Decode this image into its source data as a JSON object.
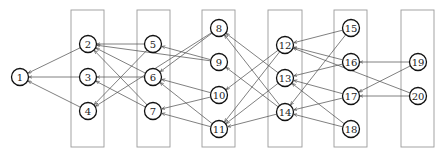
{
  "diagram": {
    "type": "layered directed graph",
    "colors": {
      "background": "#ffffff",
      "box_stroke": "#9a9a9a",
      "edge": "#555555",
      "node_stroke": "#111111",
      "label": "#222222"
    },
    "node_radius": 8.5,
    "columns": [
      {
        "id": "c1",
        "x": 71,
        "y": 10,
        "w": 33,
        "h": 137
      },
      {
        "id": "c2",
        "x": 137,
        "y": 10,
        "w": 33,
        "h": 137
      },
      {
        "id": "c3",
        "x": 202,
        "y": 10,
        "w": 33,
        "h": 137
      },
      {
        "id": "c4",
        "x": 268,
        "y": 10,
        "w": 34,
        "h": 137
      },
      {
        "id": "c5",
        "x": 334,
        "y": 10,
        "w": 33,
        "h": 137
      },
      {
        "id": "c6",
        "x": 401,
        "y": 10,
        "w": 33,
        "h": 137
      }
    ],
    "nodes": [
      {
        "id": "1",
        "label": "1",
        "x": 20,
        "y": 77
      },
      {
        "id": "2",
        "label": "2",
        "x": 88,
        "y": 44
      },
      {
        "id": "3",
        "label": "3",
        "x": 88,
        "y": 77
      },
      {
        "id": "4",
        "label": "4",
        "x": 88,
        "y": 111
      },
      {
        "id": "5",
        "label": "5",
        "x": 153,
        "y": 44
      },
      {
        "id": "6",
        "label": "6",
        "x": 153,
        "y": 77
      },
      {
        "id": "7",
        "label": "7",
        "x": 153,
        "y": 111
      },
      {
        "id": "8",
        "label": "8",
        "x": 219,
        "y": 28
      },
      {
        "id": "9",
        "label": "9",
        "x": 219,
        "y": 62
      },
      {
        "id": "10",
        "label": "10",
        "x": 219,
        "y": 95
      },
      {
        "id": "11",
        "label": "11",
        "x": 219,
        "y": 129
      },
      {
        "id": "12",
        "label": "12",
        "x": 285,
        "y": 45
      },
      {
        "id": "13",
        "label": "13",
        "x": 285,
        "y": 78
      },
      {
        "id": "14",
        "label": "14",
        "x": 285,
        "y": 112
      },
      {
        "id": "15",
        "label": "15",
        "x": 351,
        "y": 28
      },
      {
        "id": "16",
        "label": "16",
        "x": 351,
        "y": 62
      },
      {
        "id": "17",
        "label": "17",
        "x": 351,
        "y": 96
      },
      {
        "id": "18",
        "label": "18",
        "x": 351,
        "y": 129
      },
      {
        "id": "19",
        "label": "19",
        "x": 418,
        "y": 62
      },
      {
        "id": "20",
        "label": "20",
        "x": 418,
        "y": 96
      }
    ],
    "edges": [
      {
        "from": "2",
        "to": "1"
      },
      {
        "from": "3",
        "to": "1"
      },
      {
        "from": "4",
        "to": "1"
      },
      {
        "from": "5",
        "to": "2"
      },
      {
        "from": "9",
        "to": "2"
      },
      {
        "from": "6",
        "to": "2"
      },
      {
        "from": "7",
        "to": "2"
      },
      {
        "from": "6",
        "to": "3"
      },
      {
        "from": "7",
        "to": "3"
      },
      {
        "from": "5",
        "to": "4"
      },
      {
        "from": "8",
        "to": "4"
      },
      {
        "from": "9",
        "to": "5"
      },
      {
        "from": "8",
        "to": "6"
      },
      {
        "from": "10",
        "to": "6"
      },
      {
        "from": "11",
        "to": "6"
      },
      {
        "from": "10",
        "to": "7"
      },
      {
        "from": "11",
        "to": "7"
      },
      {
        "from": "13",
        "to": "8"
      },
      {
        "from": "14",
        "to": "8"
      },
      {
        "from": "14",
        "to": "9"
      },
      {
        "from": "12",
        "to": "10"
      },
      {
        "from": "12",
        "to": "11"
      },
      {
        "from": "13",
        "to": "11"
      },
      {
        "from": "14",
        "to": "11"
      },
      {
        "from": "15",
        "to": "12"
      },
      {
        "from": "16",
        "to": "12"
      },
      {
        "from": "20",
        "to": "12"
      },
      {
        "from": "16",
        "to": "13"
      },
      {
        "from": "17",
        "to": "13"
      },
      {
        "from": "18",
        "to": "13"
      },
      {
        "from": "15",
        "to": "14"
      },
      {
        "from": "17",
        "to": "14"
      },
      {
        "from": "18",
        "to": "14"
      },
      {
        "from": "19",
        "to": "16"
      },
      {
        "from": "19",
        "to": "17"
      },
      {
        "from": "20",
        "to": "17"
      }
    ]
  }
}
